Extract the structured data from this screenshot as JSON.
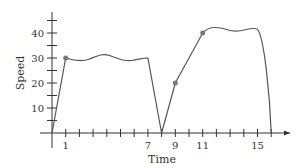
{
  "chart_data": {
    "type": "line",
    "title": "",
    "xlabel": "Time",
    "ylabel": "Speed",
    "xlim": [
      0,
      17
    ],
    "ylim": [
      0,
      48
    ],
    "x_tick_labels": [
      "1",
      "7",
      "9",
      "11",
      "15"
    ],
    "y_tick_labels": [
      "10",
      "20",
      "30",
      "40"
    ],
    "grid": false,
    "series": [
      {
        "name": "Speed",
        "x": [
          0,
          1,
          2,
          3,
          4,
          5,
          6,
          7,
          8,
          9,
          10,
          11,
          11.5,
          12.5,
          13.5,
          14.5,
          15,
          15.5,
          16
        ],
        "values": [
          0,
          30,
          29,
          29.5,
          31.5,
          29.5,
          29,
          30,
          0,
          20,
          31,
          40,
          42,
          42,
          40.5,
          42,
          41.5,
          30,
          0
        ]
      }
    ],
    "marked_points": [
      {
        "x": 1,
        "y": 30
      },
      {
        "x": 9,
        "y": 20
      },
      {
        "x": 11,
        "y": 40
      }
    ],
    "colors": {
      "line": "#555555",
      "axis": "#333333",
      "marker": "#777777"
    }
  }
}
